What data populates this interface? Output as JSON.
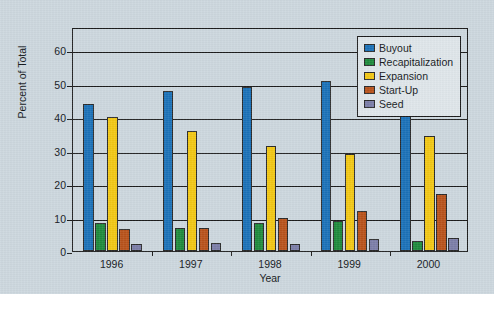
{
  "chart_data": {
    "type": "bar",
    "title": "",
    "xlabel": "Year",
    "ylabel": "Percent of Total",
    "categories": [
      "1996",
      "1997",
      "1998",
      "1999",
      "2000"
    ],
    "ylim": [
      0,
      67
    ],
    "yticks": [
      0,
      10,
      20,
      30,
      40,
      50,
      60
    ],
    "ytick_labels": [
      "0",
      "10",
      "20",
      "30",
      "40",
      "50",
      "60"
    ],
    "grid": true,
    "legend_position": "top-right",
    "series": [
      {
        "name": "Buyout",
        "color": "#1a71b8",
        "values": [
          44,
          48,
          49,
          51,
          41
        ]
      },
      {
        "name": "Recapitalization",
        "color": "#1e8a3c",
        "values": [
          8.5,
          7,
          8.5,
          9,
          3
        ]
      },
      {
        "name": "Expansion",
        "color": "#f2c714",
        "values": [
          40,
          36,
          31.5,
          29,
          34.5
        ]
      },
      {
        "name": "Start-Up",
        "color": "#b8521a",
        "values": [
          6.5,
          7,
          10,
          12,
          17
        ]
      },
      {
        "name": "Seed",
        "color": "#7b7da8",
        "values": [
          2,
          2.5,
          2,
          3.5,
          4
        ]
      }
    ]
  },
  "figure": {
    "background_color": "#ccd7de",
    "axis_color": "#1c1c1c"
  }
}
